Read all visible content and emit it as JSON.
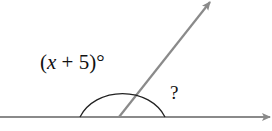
{
  "diagram": {
    "type": "supplementary-angles",
    "angle1": {
      "prefix": "(",
      "variable": "x",
      "suffix": " + 5)°"
    },
    "angle2": {
      "label": "?"
    },
    "colors": {
      "line": "#8a8a8a",
      "arc": "#222222",
      "text": "#111111"
    }
  }
}
